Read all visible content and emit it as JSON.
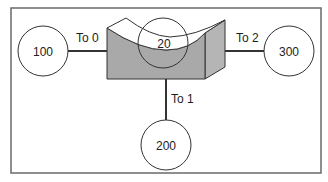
{
  "diagram": {
    "center_node": {
      "label": "20"
    },
    "nodes": [
      {
        "id": "n100",
        "label": "100"
      },
      {
        "id": "n200",
        "label": "200"
      },
      {
        "id": "n300",
        "label": "300"
      }
    ],
    "edges": [
      {
        "label": "To 0",
        "target": "100"
      },
      {
        "label": "To 1",
        "target": "200"
      },
      {
        "label": "To 2",
        "target": "300"
      }
    ],
    "colors": {
      "frame": "#6a6a6a",
      "shape_fill": "#a9a9a9",
      "side_fill": "#b5b5b5",
      "stroke": "#333333"
    }
  }
}
